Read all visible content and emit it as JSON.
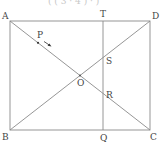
{
  "diagram": {
    "type": "geometry",
    "colors": {
      "line": "#8a8a8a",
      "label": "#444444",
      "point": "#333333"
    },
    "points": {
      "A": {
        "label": "A",
        "x": 10,
        "y": 21
      },
      "B": {
        "label": "B",
        "x": 10,
        "y": 130
      },
      "C": {
        "label": "C",
        "x": 150,
        "y": 130
      },
      "D": {
        "label": "D",
        "x": 150,
        "y": 21
      },
      "T": {
        "label": "T",
        "x": 103,
        "y": 21
      },
      "Q": {
        "label": "Q",
        "x": 103,
        "y": 130
      },
      "O": {
        "label": "O",
        "x": 80,
        "y": 75.5
      },
      "S": {
        "label": "S",
        "x": 103,
        "y": 57.6
      },
      "R": {
        "label": "R",
        "x": 103,
        "y": 93.4
      },
      "P": {
        "label": "P",
        "x": 38,
        "y": 42.8
      }
    },
    "segments": [
      {
        "from": "A",
        "to": "D"
      },
      {
        "from": "D",
        "to": "C"
      },
      {
        "from": "C",
        "to": "B"
      },
      {
        "from": "B",
        "to": "A"
      },
      {
        "from": "A",
        "to": "C"
      },
      {
        "from": "B",
        "to": "D"
      },
      {
        "from": "T",
        "to": "Q"
      }
    ],
    "arrow": {
      "from": "P",
      "direction": "toward O"
    },
    "top_cropped_text": "( ( 3 ·  4 )  ·  )"
  }
}
